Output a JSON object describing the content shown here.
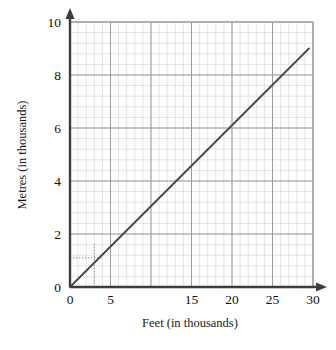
{
  "chart_data": {
    "type": "line",
    "title": "",
    "xlabel": "Feet (in thousands)",
    "ylabel": "Metres (in thousands)",
    "xlim": [
      0,
      30
    ],
    "ylim": [
      0,
      10
    ],
    "grid": true,
    "legend_position": "none",
    "x_ticks": [
      0,
      5,
      10,
      15,
      20,
      25,
      30
    ],
    "x_tick_labels": [
      "0",
      "5",
      "",
      "15",
      "20",
      "25",
      "30"
    ],
    "y_ticks": [
      0,
      2,
      4,
      6,
      8,
      10
    ],
    "y_tick_labels": [
      "0",
      "2",
      "4",
      "6",
      "8",
      "10"
    ],
    "x_minor_step": 1,
    "y_minor_step": 0.4,
    "series": [
      {
        "name": "feet-to-metres-conversion",
        "x": [
          0,
          29.5
        ],
        "y": [
          0,
          9.0
        ],
        "color": "#4a4a4a"
      }
    ],
    "annotations": [
      {
        "name": "construction-lines",
        "style": "dotted",
        "x_value": 3.0,
        "y_value": 1.1,
        "color": "#8a8a8a"
      }
    ],
    "axis_arrows": {
      "x_axis_arrow": "right",
      "y_axis_arrow": "up"
    },
    "colors": {
      "axis": "#3d3d3d",
      "line": "#4a4a4a",
      "grid_minor": "#d8d8d8",
      "grid_major": "#9a9aa0",
      "text": "#111111",
      "background": "#ffffff"
    }
  },
  "labels": {
    "x_axis_title": "Feet (in thousands)",
    "y_axis_title": "Metres (in thousands)"
  }
}
